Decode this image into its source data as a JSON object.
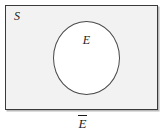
{
  "figure": {
    "name": "venn-diagram-complement",
    "sample_space_label": "S",
    "event_label": "E",
    "caption_label": "E",
    "caption_has_overline": true,
    "colors": {
      "page_background": "#ffffff",
      "sample_space_fill": "#f2f2f2",
      "sample_space_border": "#3a3a3a",
      "sample_space_shadow": "#b9b9b9",
      "event_fill": "#ffffff",
      "event_border": "#4a4a4a",
      "text": "#1a1a1a"
    }
  }
}
